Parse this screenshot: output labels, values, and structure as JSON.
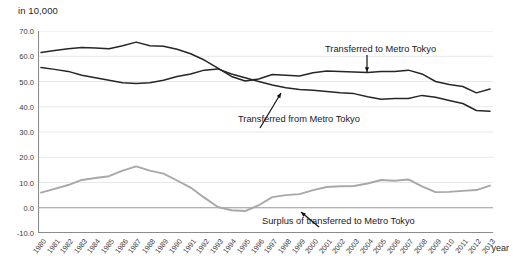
{
  "axes": {
    "unit_note": "in 10,000",
    "x_axis_title": "year",
    "y_ticks": [
      "70.0",
      "60.0",
      "50.0",
      "40.0",
      "30.0",
      "20.0",
      "10.0",
      "0.0",
      "-10.0"
    ]
  },
  "annotations": {
    "to_tokyo": "Transferred to Metro Tokyo",
    "from_tokyo": "Transferred from Metro Tokyo",
    "surplus": "Surplus of transferred to Metro Tokyo"
  },
  "chart_data": {
    "type": "line",
    "title": "",
    "subtitle": "",
    "xlabel": "year",
    "ylabel": "in 10,000",
    "ylim": [
      -10,
      70
    ],
    "y_ticks": [
      70,
      60,
      50,
      40,
      30,
      20,
      10,
      0,
      -10
    ],
    "grid": true,
    "legend_position": "inline-annotations",
    "categories": [
      "1980",
      "1981",
      "1982",
      "1983",
      "1984",
      "1985",
      "1986",
      "1987",
      "1988",
      "1989",
      "1990",
      "1991",
      "1992",
      "1993",
      "1994",
      "1995",
      "1996",
      "1997",
      "1998",
      "1999",
      "2000",
      "2001",
      "2002",
      "2003",
      "2004",
      "2005",
      "2006",
      "2007",
      "2008",
      "2009",
      "2010",
      "2011",
      "2012",
      "2013"
    ],
    "series": [
      {
        "name": "Transferred to Metro Tokyo",
        "color": "#262626",
        "values": [
          61.5,
          62.3,
          63.0,
          63.5,
          63.3,
          63.0,
          64.2,
          65.6,
          64.2,
          64.0,
          62.8,
          61.0,
          58.5,
          55.3,
          52.0,
          50.2,
          51.0,
          52.8,
          52.5,
          52.2,
          53.5,
          54.2,
          54.0,
          53.8,
          53.6,
          54.0,
          54.0,
          54.5,
          53.0,
          50.0,
          48.8,
          48.0,
          45.5,
          47.0
        ]
      },
      {
        "name": "Transferred from Metro Tokyo",
        "color": "#262626",
        "values": [
          55.5,
          54.8,
          54.0,
          52.5,
          51.5,
          50.5,
          49.5,
          49.2,
          49.5,
          50.5,
          52.0,
          53.0,
          54.5,
          55.0,
          53.0,
          51.5,
          50.0,
          48.6,
          47.5,
          46.8,
          46.5,
          46.0,
          45.5,
          45.2,
          44.0,
          43.0,
          43.3,
          43.3,
          44.5,
          43.8,
          42.5,
          41.3,
          38.5,
          38.2
        ]
      },
      {
        "name": "Surplus of transferred to Metro Tokyo",
        "color": "#a8a8a8",
        "values": [
          6.0,
          7.5,
          9.0,
          11.0,
          11.8,
          12.5,
          14.7,
          16.4,
          14.7,
          13.5,
          10.8,
          8.0,
          4.0,
          0.3,
          -1.0,
          -1.3,
          1.0,
          4.2,
          5.0,
          5.4,
          7.0,
          8.2,
          8.5,
          8.6,
          9.6,
          11.0,
          10.7,
          11.2,
          8.5,
          6.2,
          6.3,
          6.7,
          7.0,
          8.8
        ]
      }
    ]
  }
}
